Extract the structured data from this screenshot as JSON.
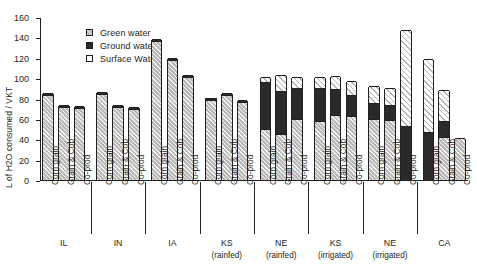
{
  "chart_data": {
    "type": "bar",
    "subtype": "stacked-vertical",
    "title": "",
    "xlabel": "",
    "ylabel": "L of H2O consumed / VKT",
    "ylim": [
      0,
      160
    ],
    "yticks": [
      0,
      20,
      40,
      60,
      80,
      100,
      120,
      140,
      160
    ],
    "grid": false,
    "legend_position": "top-left-inside",
    "legend": [
      "Green water",
      "Ground water",
      "Surface Water"
    ],
    "series": [
      {
        "name": "Green water",
        "color": "#b9b9b9",
        "pattern": "hatch",
        "values": [
          83,
          72,
          71,
          84,
          72,
          70,
          136,
          118,
          101,
          79,
          83,
          77,
          50,
          45,
          60,
          58,
          64,
          63,
          60,
          59,
          0,
          0,
          42,
          41
        ]
      },
      {
        "name": "Ground water",
        "color": "#2a2a2a",
        "pattern": "solid",
        "values": [
          2,
          2,
          2,
          2,
          2,
          2,
          2,
          2,
          2,
          2,
          2,
          2,
          46,
          42,
          30,
          32,
          25,
          20,
          16,
          15,
          53,
          47,
          16,
          0
        ]
      },
      {
        "name": "Surface Water",
        "color": "#ffffff",
        "pattern": "diagonal-hatch",
        "values": [
          0,
          0,
          0,
          0,
          0,
          0,
          0,
          0,
          0,
          0,
          0,
          0,
          5,
          16,
          11,
          11,
          13,
          14,
          16,
          16,
          94,
          72,
          30,
          0
        ]
      }
    ],
    "categories": [
      "Corn grain",
      "Grain & Cob",
      "Co-prod",
      "Corn grain",
      "Grain & Cob",
      "Co-prod",
      "Corn grain",
      "Grain & Cob",
      "Co-prod",
      "Corn grain",
      "Grain & Cob",
      "Co-prod",
      "Corn grain",
      "Grain & Cob",
      "Co-prod",
      "Corn grain",
      "Grain & Cob",
      "Co-prod",
      "Corn grain",
      "Grain & Cob",
      "Co-prod",
      "Corn grain",
      "Grain & Cob",
      "Co-prod"
    ],
    "groups": [
      {
        "label": "IL",
        "sublabel": ""
      },
      {
        "label": "IN",
        "sublabel": ""
      },
      {
        "label": "IA",
        "sublabel": ""
      },
      {
        "label": "KS",
        "sublabel": "(rainfed)"
      },
      {
        "label": "NE",
        "sublabel": "(rainfed)"
      },
      {
        "label": "KS",
        "sublabel": "(irrigated)"
      },
      {
        "label": "NE",
        "sublabel": "(irrigated)"
      },
      {
        "label": "CA",
        "sublabel": ""
      }
    ],
    "bar_totals": [
      85,
      74,
      73,
      86,
      74,
      72,
      138,
      120,
      103,
      81,
      85,
      79,
      101,
      103,
      101,
      101,
      102,
      97,
      92,
      90,
      147,
      119,
      88,
      41
    ]
  }
}
